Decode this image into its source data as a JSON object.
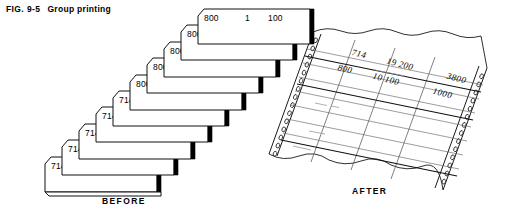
{
  "figure": {
    "label": "FIG. 9-5",
    "title": "Group printing"
  },
  "before": {
    "caption": "BEFORE",
    "cards": [
      {
        "account": "800",
        "qty": "1",
        "amount": "100"
      },
      {
        "account": "800",
        "qty": "2",
        "amount": "100"
      },
      {
        "account": "800",
        "qty": "2",
        "amount": "100"
      },
      {
        "account": "800",
        "qty": "3",
        "amount": "100"
      },
      {
        "account": "800",
        "qty": "2",
        "amount": "100"
      },
      {
        "account": "714",
        "qty": "3",
        "amount": "200"
      },
      {
        "account": "714",
        "qty": "9",
        "amount": "200"
      },
      {
        "account": "714",
        "qty": "4",
        "amount": "200"
      },
      {
        "account": "714",
        "qty": "2",
        "amount": "200"
      },
      {
        "account": "714",
        "qty": "1",
        "amount": "200"
      }
    ]
  },
  "after": {
    "caption": "AFTER",
    "report_rows": [
      {
        "account": "714",
        "qty": "19",
        "unit": "200",
        "total": "3800"
      },
      {
        "account": "800",
        "qty": "10",
        "unit": "100",
        "total": "1000"
      }
    ]
  },
  "colors": {
    "ink": "#000000",
    "paper": "#ffffff",
    "shadow": "#000000",
    "rule": "#3a3a3a"
  }
}
